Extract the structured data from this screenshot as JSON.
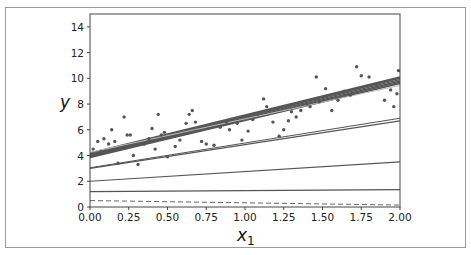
{
  "chart_data": {
    "type": "line",
    "title": "",
    "xlabel": "x1",
    "xlabel_main": "x",
    "xlabel_sub": "1",
    "ylabel": "y",
    "xlim": [
      0,
      2
    ],
    "ylim": [
      0,
      15
    ],
    "x_ticks": [
      "0.00",
      "0.25",
      "0.50",
      "0.75",
      "1.00",
      "1.25",
      "1.50",
      "1.75",
      "2.00"
    ],
    "x_tick_values": [
      0,
      0.25,
      0.5,
      0.75,
      1.0,
      1.25,
      1.5,
      1.75,
      2.0
    ],
    "y_ticks": [
      "0",
      "2",
      "4",
      "6",
      "8",
      "10",
      "12",
      "14"
    ],
    "y_tick_values": [
      0,
      2,
      4,
      6,
      8,
      10,
      12,
      14
    ],
    "grid": false,
    "legend": null,
    "scatter": {
      "name": "training data",
      "color": "#555555",
      "points": [
        [
          0.02,
          4.5
        ],
        [
          0.05,
          5.1
        ],
        [
          0.07,
          4.3
        ],
        [
          0.09,
          5.3
        ],
        [
          0.12,
          4.9
        ],
        [
          0.14,
          6.0
        ],
        [
          0.16,
          5.1
        ],
        [
          0.18,
          3.4
        ],
        [
          0.22,
          7.0
        ],
        [
          0.24,
          5.6
        ],
        [
          0.26,
          5.6
        ],
        [
          0.28,
          4.0
        ],
        [
          0.31,
          3.3
        ],
        [
          0.35,
          4.9
        ],
        [
          0.38,
          5.3
        ],
        [
          0.4,
          6.1
        ],
        [
          0.42,
          4.5
        ],
        [
          0.44,
          7.2
        ],
        [
          0.46,
          5.6
        ],
        [
          0.48,
          5.8
        ],
        [
          0.5,
          3.9
        ],
        [
          0.55,
          4.7
        ],
        [
          0.58,
          5.2
        ],
        [
          0.62,
          6.5
        ],
        [
          0.64,
          7.2
        ],
        [
          0.66,
          7.5
        ],
        [
          0.68,
          6.6
        ],
        [
          0.72,
          5.1
        ],
        [
          0.75,
          4.9
        ],
        [
          0.8,
          4.8
        ],
        [
          0.84,
          6.2
        ],
        [
          0.88,
          6.6
        ],
        [
          0.9,
          6.0
        ],
        [
          0.95,
          6.5
        ],
        [
          0.98,
          5.2
        ],
        [
          1.02,
          5.9
        ],
        [
          1.05,
          6.8
        ],
        [
          1.08,
          7.2
        ],
        [
          1.12,
          8.4
        ],
        [
          1.14,
          7.8
        ],
        [
          1.18,
          6.6
        ],
        [
          1.22,
          5.5
        ],
        [
          1.25,
          6.0
        ],
        [
          1.28,
          6.7
        ],
        [
          1.3,
          7.4
        ],
        [
          1.33,
          7.0
        ],
        [
          1.36,
          7.5
        ],
        [
          1.4,
          8.0
        ],
        [
          1.42,
          7.8
        ],
        [
          1.46,
          10.1
        ],
        [
          1.48,
          8.2
        ],
        [
          1.52,
          9.2
        ],
        [
          1.56,
          7.5
        ],
        [
          1.6,
          8.3
        ],
        [
          1.64,
          9.0
        ],
        [
          1.68,
          8.7
        ],
        [
          1.72,
          10.9
        ],
        [
          1.75,
          10.2
        ],
        [
          1.8,
          10.1
        ],
        [
          1.85,
          9.4
        ],
        [
          1.9,
          8.3
        ],
        [
          1.94,
          9.1
        ],
        [
          1.96,
          7.8
        ],
        [
          1.98,
          8.8
        ],
        [
          1.99,
          10.6
        ]
      ]
    },
    "series": [
      {
        "name": "dashed initial",
        "x": [
          0,
          2
        ],
        "y": [
          0.5,
          0.15
        ],
        "style": "dashed",
        "width": 1,
        "color": "#666666"
      },
      {
        "name": "line 2",
        "x": [
          0,
          2
        ],
        "y": [
          1.2,
          1.35
        ],
        "style": "solid",
        "width": 1.2,
        "color": "#555555"
      },
      {
        "name": "line 3",
        "x": [
          0,
          2
        ],
        "y": [
          2.0,
          3.5
        ],
        "style": "solid",
        "width": 1.2,
        "color": "#555555"
      },
      {
        "name": "line 4a",
        "x": [
          0,
          2
        ],
        "y": [
          3.0,
          6.7
        ],
        "style": "solid",
        "width": 1.2,
        "color": "#555555"
      },
      {
        "name": "line 4b",
        "x": [
          0,
          2
        ],
        "y": [
          3.05,
          6.9
        ],
        "style": "solid",
        "width": 1.2,
        "color": "#555555"
      },
      {
        "name": "band 1",
        "x": [
          0,
          2
        ],
        "y": [
          3.85,
          9.6
        ],
        "style": "solid",
        "width": 1.4,
        "color": "#555555"
      },
      {
        "name": "band 2",
        "x": [
          0,
          2
        ],
        "y": [
          3.9,
          9.7
        ],
        "style": "solid",
        "width": 1.4,
        "color": "#555555"
      },
      {
        "name": "band 3",
        "x": [
          0,
          2
        ],
        "y": [
          3.95,
          9.8
        ],
        "style": "solid",
        "width": 1.4,
        "color": "#555555"
      },
      {
        "name": "band 4",
        "x": [
          0,
          2
        ],
        "y": [
          4.0,
          9.9
        ],
        "style": "solid",
        "width": 1.4,
        "color": "#555555"
      },
      {
        "name": "band 5",
        "x": [
          0,
          2
        ],
        "y": [
          4.05,
          10.0
        ],
        "style": "solid",
        "width": 1.4,
        "color": "#555555"
      },
      {
        "name": "band 6",
        "x": [
          0,
          2
        ],
        "y": [
          4.1,
          10.05
        ],
        "style": "solid",
        "width": 1.4,
        "color": "#555555"
      },
      {
        "name": "band 7",
        "x": [
          0,
          2
        ],
        "y": [
          4.2,
          10.1
        ],
        "style": "solid",
        "width": 1.4,
        "color": "#555555"
      },
      {
        "name": "band highlight",
        "x": [
          0,
          2
        ],
        "y": [
          4.25,
          9.45
        ],
        "style": "solid",
        "width": 1.0,
        "color": "#bbbbbb"
      }
    ]
  }
}
